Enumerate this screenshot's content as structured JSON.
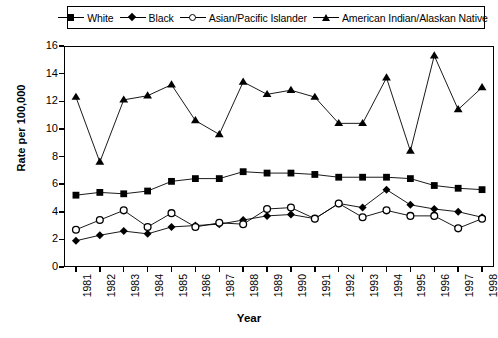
{
  "chart_data": {
    "type": "line",
    "title": "",
    "xlabel": "Year",
    "ylabel": "Rate per 100,000",
    "ylim": [
      0,
      16
    ],
    "ytick_step": 2,
    "yticks": [
      0,
      2,
      4,
      6,
      8,
      10,
      12,
      14,
      16
    ],
    "grid": false,
    "legend_position": "top",
    "categories": [
      "1981",
      "1982",
      "1983",
      "1984",
      "1985",
      "1986",
      "1987",
      "1988",
      "1989",
      "1990",
      "1991",
      "1992",
      "1993",
      "1994",
      "1995",
      "1996",
      "1997",
      "1998"
    ],
    "series": [
      {
        "name": "White",
        "marker": "filled-square",
        "color": "#000000",
        "values": [
          5.2,
          5.4,
          5.3,
          5.5,
          6.2,
          6.4,
          6.4,
          6.9,
          6.8,
          6.8,
          6.7,
          6.5,
          6.5,
          6.5,
          6.4,
          5.9,
          5.7,
          5.6
        ]
      },
      {
        "name": "Black",
        "marker": "filled-diamond",
        "color": "#000000",
        "values": [
          1.9,
          2.3,
          2.6,
          2.4,
          2.9,
          3.0,
          3.1,
          3.4,
          3.7,
          3.8,
          3.5,
          4.6,
          4.3,
          5.6,
          4.5,
          4.2,
          4.0,
          3.6
        ]
      },
      {
        "name": "Asian/Pacific Islander",
        "marker": "open-circle",
        "color": "#000000",
        "values": [
          2.7,
          3.4,
          4.1,
          2.9,
          3.9,
          2.9,
          3.2,
          3.1,
          4.2,
          4.3,
          3.5,
          4.6,
          3.6,
          4.1,
          3.7,
          3.7,
          2.8,
          3.5
        ]
      },
      {
        "name": "American Indian/Alaskan Native",
        "marker": "filled-triangle",
        "color": "#000000",
        "values": [
          12.3,
          7.6,
          12.1,
          12.4,
          13.2,
          10.6,
          9.6,
          13.4,
          12.5,
          12.8,
          12.3,
          10.4,
          10.4,
          13.7,
          8.4,
          15.3,
          11.4,
          13.0
        ]
      }
    ]
  }
}
